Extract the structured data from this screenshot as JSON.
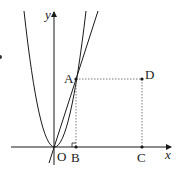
{
  "diagram": {
    "type": "coordinate-geometry",
    "axes": {
      "x_label": "x",
      "y_label": "y",
      "origin_label": "O"
    },
    "points": [
      {
        "label": "A",
        "role": "intersection of parabola and line"
      },
      {
        "label": "B",
        "role": "foot of perpendicular from A on x-axis"
      },
      {
        "label": "C",
        "role": "point on x-axis"
      },
      {
        "label": "D",
        "role": "vertex of rectangle above C"
      }
    ],
    "curves": [
      {
        "name": "parabola",
        "vertex": "O"
      },
      {
        "name": "line",
        "passes_through": [
          "O",
          "A"
        ]
      }
    ],
    "dashed_segments": [
      "AD",
      "AB",
      "DC"
    ],
    "right_angle_marker_at": "B",
    "colors": {
      "stroke": "#1a1a1a",
      "dotted": "#555555"
    }
  }
}
